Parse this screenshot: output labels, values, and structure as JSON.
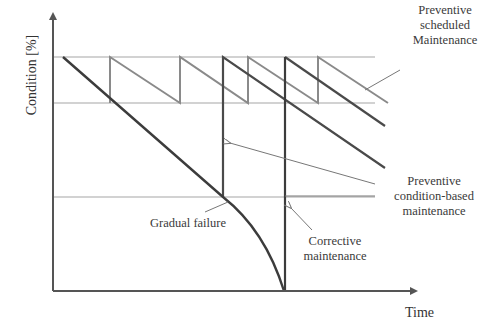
{
  "diagram": {
    "title": "",
    "axes": {
      "y_label": "Condition [%]",
      "x_label": "Time"
    },
    "labels": {
      "preventive_scheduled": [
        "Preventive",
        "scheduled",
        "Maintenance"
      ],
      "preventive_condition_based": [
        "Preventive",
        "condition-based",
        "maintenance"
      ],
      "gradual_failure": "Gradual failure",
      "corrective": [
        "Corrective",
        "maintenance"
      ]
    },
    "colors": {
      "axis": "#555555",
      "threshold": "#9a9a9a",
      "scheduled": "#8a8a8a",
      "condition_based": "#4a4a4a",
      "failure": "#3c3c3c",
      "annotation": "#777777",
      "text": "#3a3a3a"
    }
  }
}
